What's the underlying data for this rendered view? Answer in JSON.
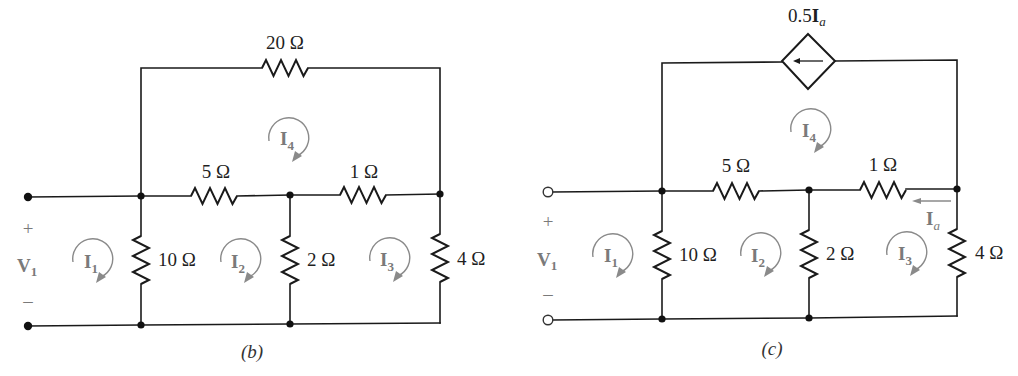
{
  "figure": {
    "colors": {
      "wire": "#1a1a1a",
      "mesh_arrow": "#8a8a8a",
      "label": "#1f1f1f",
      "source_label": "#7a7a7a"
    },
    "diagrams": [
      {
        "id": "b",
        "caption": "(b)",
        "caption_open": "(",
        "caption_letter": "b",
        "caption_close": ")",
        "source": {
          "name": "V",
          "sub": "1",
          "plus": "+",
          "minus": "–",
          "terminal_style": "solid"
        },
        "resistors": [
          {
            "id": "R20",
            "value": "20 Ω",
            "position": "top branch"
          },
          {
            "id": "R5",
            "value": "5 Ω",
            "position": "middle horizontal left"
          },
          {
            "id": "R1",
            "value": "1 Ω",
            "position": "middle horizontal right"
          },
          {
            "id": "R10",
            "value": "10 Ω",
            "position": "vertical left"
          },
          {
            "id": "R2",
            "value": "2 Ω",
            "position": "vertical middle"
          },
          {
            "id": "R4",
            "value": "4 Ω",
            "position": "vertical right"
          }
        ],
        "meshes": [
          {
            "name": "I",
            "sub": "1",
            "direction": "clockwise"
          },
          {
            "name": "I",
            "sub": "2",
            "direction": "clockwise"
          },
          {
            "name": "I",
            "sub": "3",
            "direction": "clockwise"
          },
          {
            "name": "I",
            "sub": "4",
            "direction": "clockwise"
          }
        ]
      },
      {
        "id": "c",
        "caption": "(c)",
        "caption_open": "(",
        "caption_letter": "c",
        "caption_close": ")",
        "source": {
          "name": "V",
          "sub": "1",
          "plus": "+",
          "minus": "–",
          "terminal_style": "open"
        },
        "dependent_source": {
          "type": "current-controlled current source",
          "gain": "0.5",
          "controlling": "I",
          "controlling_sub": "a",
          "arrow_direction": "left"
        },
        "resistors": [
          {
            "id": "R5",
            "value": "5 Ω",
            "position": "middle horizontal left"
          },
          {
            "id": "R1",
            "value": "1 Ω",
            "position": "middle horizontal right"
          },
          {
            "id": "R10",
            "value": "10 Ω",
            "position": "vertical left"
          },
          {
            "id": "R2",
            "value": "2 Ω",
            "position": "vertical middle"
          },
          {
            "id": "R4",
            "value": "4 Ω",
            "position": "vertical right"
          }
        ],
        "branch_current": {
          "name": "I",
          "sub": "a",
          "through": "1 Ω",
          "direction": "left"
        },
        "meshes": [
          {
            "name": "I",
            "sub": "1",
            "direction": "clockwise"
          },
          {
            "name": "I",
            "sub": "2",
            "direction": "clockwise"
          },
          {
            "name": "I",
            "sub": "3",
            "direction": "clockwise"
          },
          {
            "name": "I",
            "sub": "4",
            "direction": "clockwise"
          }
        ]
      }
    ]
  }
}
